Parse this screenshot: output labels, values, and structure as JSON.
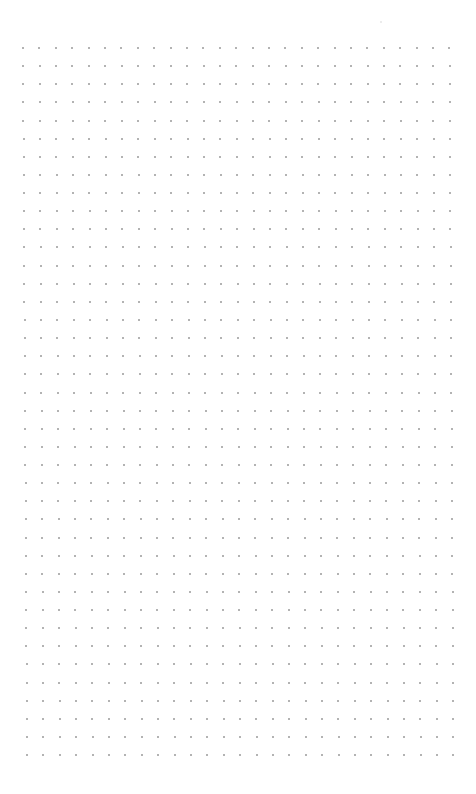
{
  "page": {
    "type": "dot-grid-notebook-page",
    "background_color": "#ffffff",
    "dot_color": "#9a9a9a",
    "dot_size_px": 2
  },
  "grid": {
    "columns": 27,
    "rows": 40,
    "origin_top_left": {
      "x": 22,
      "y": 47
    },
    "origin_bottom_left": {
      "x": 26,
      "y": 754
    },
    "col_spacing_px": 16.4,
    "row_spacing_px": 18.13
  },
  "stray_marks": [
    {
      "x": 380,
      "y": 21,
      "color": "#e6e6e6"
    }
  ]
}
